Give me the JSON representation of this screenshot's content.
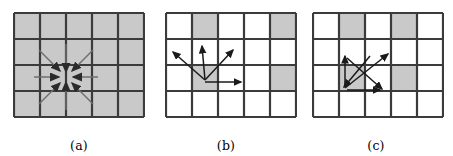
{
  "figure": {
    "background_color": "#ffffff",
    "grid": {
      "cols": 5,
      "rows": 4,
      "cell_width": 26,
      "cell_height": 26,
      "line_color": "#3b3b3b",
      "line_width": 2.2,
      "shaded_color": "#c9c9c9",
      "empty_color": "#ffffff",
      "arrow_color": "#2b2b2b",
      "arrow_width": 1.6
    },
    "panels": [
      {
        "id": "a",
        "caption": "(a)",
        "name": "panel-a",
        "description": "all-cells-shaded grid with eight arrows converging inward on center point",
        "shaded_cells": [
          [
            1,
            1
          ],
          [
            1,
            2
          ],
          [
            1,
            3
          ],
          [
            1,
            4
          ],
          [
            1,
            5
          ],
          [
            2,
            1
          ],
          [
            2,
            2
          ],
          [
            2,
            3
          ],
          [
            2,
            4
          ],
          [
            2,
            5
          ],
          [
            3,
            1
          ],
          [
            3,
            2
          ],
          [
            3,
            3
          ],
          [
            3,
            4
          ],
          [
            3,
            5
          ],
          [
            4,
            1
          ],
          [
            4,
            2
          ],
          [
            4,
            3
          ],
          [
            4,
            4
          ],
          [
            4,
            5
          ]
        ],
        "center": [
          65,
          65
        ],
        "arrow_direction": "inward",
        "arrows": [
          {
            "name": "arrow-from-up",
            "angle_deg": 90,
            "length": 33
          },
          {
            "name": "arrow-from-up-right",
            "angle_deg": 45,
            "length": 38
          },
          {
            "name": "arrow-from-right",
            "angle_deg": 0,
            "length": 33
          },
          {
            "name": "arrow-from-down-right",
            "angle_deg": -45,
            "length": 38
          },
          {
            "name": "arrow-from-down",
            "angle_deg": -90,
            "length": 33
          },
          {
            "name": "arrow-from-down-left",
            "angle_deg": -135,
            "length": 38
          },
          {
            "name": "arrow-from-left",
            "angle_deg": 180,
            "length": 33
          },
          {
            "name": "arrow-from-up-left",
            "angle_deg": 135,
            "length": 38
          }
        ]
      },
      {
        "id": "b",
        "caption": "(b)",
        "name": "panel-b",
        "description": "mostly empty grid with four shaded cells and four arrows radiating outward from center cell",
        "shaded_cells": [
          [
            1,
            2
          ],
          [
            1,
            5
          ],
          [
            3,
            2
          ],
          [
            3,
            5
          ]
        ],
        "center": [
          39,
          65
        ],
        "arrow_direction": "outward",
        "arrows": [
          {
            "name": "arrow-to-up-left",
            "angle_deg": 150,
            "length": 36
          },
          {
            "name": "arrow-to-up",
            "angle_deg": 90,
            "length": 34
          },
          {
            "name": "arrow-to-up-right",
            "angle_deg": 52,
            "length": 38
          },
          {
            "name": "arrow-to-right",
            "angle_deg": 0,
            "length": 34
          }
        ]
      },
      {
        "id": "c",
        "caption": "(c)",
        "name": "panel-c",
        "description": "grid with four shaded cells and four arrows crossing in an X pattern between two cell corners",
        "shaded_cells": [
          [
            1,
            2
          ],
          [
            1,
            4
          ],
          [
            3,
            2
          ],
          [
            3,
            4
          ]
        ],
        "center": [
          52,
          65
        ],
        "arrow_direction": "crossing",
        "arrows": [
          {
            "name": "arrow-crossing-up-right",
            "x1": 39,
            "y1": 78,
            "x2": 78,
            "y2": 46
          },
          {
            "name": "arrow-crossing-down-right",
            "x1": 39,
            "y1": 52,
            "x2": 72,
            "y2": 78
          },
          {
            "name": "arrow-crossing-up",
            "x1": 39,
            "y1": 78,
            "x2": 39,
            "y2": 47
          },
          {
            "name": "arrow-crossing-right",
            "x1": 39,
            "y1": 80,
            "x2": 72,
            "y2": 80
          },
          {
            "name": "arrow-crossing-down-left",
            "x1": 60,
            "y1": 46,
            "x2": 39,
            "y2": 78
          }
        ]
      }
    ]
  }
}
